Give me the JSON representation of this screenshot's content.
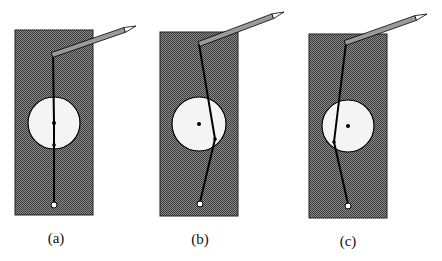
{
  "figure": {
    "colors": {
      "board": "#6a6a6a",
      "board_dark": "#3a3a3a",
      "hole": "#f4f4f4",
      "line": "#000000",
      "pencil": "#9a9a9a"
    },
    "panels": [
      {
        "label": "(a)",
        "rect": [
          15,
          30,
          78,
          185
        ],
        "circle": [
          54,
          123,
          26
        ],
        "path": [
          [
            53,
            55
          ],
          [
            54,
            123
          ],
          [
            54,
            145
          ],
          [
            54,
            203
          ]
        ],
        "knot": [
          54,
          145
        ],
        "center_dot": [
          54,
          123
        ],
        "end": [
          54,
          205
        ],
        "pencil": [
          [
            52,
            55
          ],
          [
            136,
            26
          ]
        ]
      },
      {
        "label": "(b)",
        "rect": [
          160,
          32,
          78,
          184
        ],
        "circle": [
          199,
          124,
          27
        ],
        "path": [
          [
            199,
            44
          ],
          [
            215,
            139
          ],
          [
            200,
            202
          ]
        ],
        "knot": [
          215,
          139
        ],
        "center_dot": [
          199,
          124
        ],
        "end": [
          200,
          204
        ],
        "pencil": [
          [
            199,
            44
          ],
          [
            284,
            12
          ]
        ]
      },
      {
        "label": "(c)",
        "rect": [
          309,
          34,
          78,
          184
        ],
        "circle": [
          348,
          126,
          26
        ],
        "path": [
          [
            346,
            43
          ],
          [
            334,
            142
          ],
          [
            348,
            204
          ]
        ],
        "knot": [
          334,
          142
        ],
        "center_dot": [
          348,
          126
        ],
        "end": [
          348,
          206
        ],
        "pencil": [
          [
            345,
            43
          ],
          [
            427,
            14
          ]
        ]
      }
    ]
  }
}
